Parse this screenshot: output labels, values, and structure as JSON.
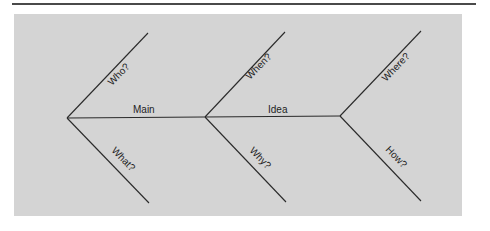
{
  "diagram": {
    "type": "fishbone-question-organizer",
    "spine_labels": [
      "Main",
      "Idea"
    ],
    "branches": [
      {
        "label": "Who?",
        "position": "upper",
        "column": 1
      },
      {
        "label": "What?",
        "position": "lower",
        "column": 1
      },
      {
        "label": "When?",
        "position": "upper",
        "column": 2
      },
      {
        "label": "Why?",
        "position": "lower",
        "column": 2
      },
      {
        "label": "Where?",
        "position": "upper",
        "column": 3
      },
      {
        "label": "How?",
        "position": "lower",
        "column": 3
      }
    ],
    "colors": {
      "panel": "#d4d4d4",
      "lines": "#2a2a2a",
      "rule": "#4a4a4a"
    }
  }
}
